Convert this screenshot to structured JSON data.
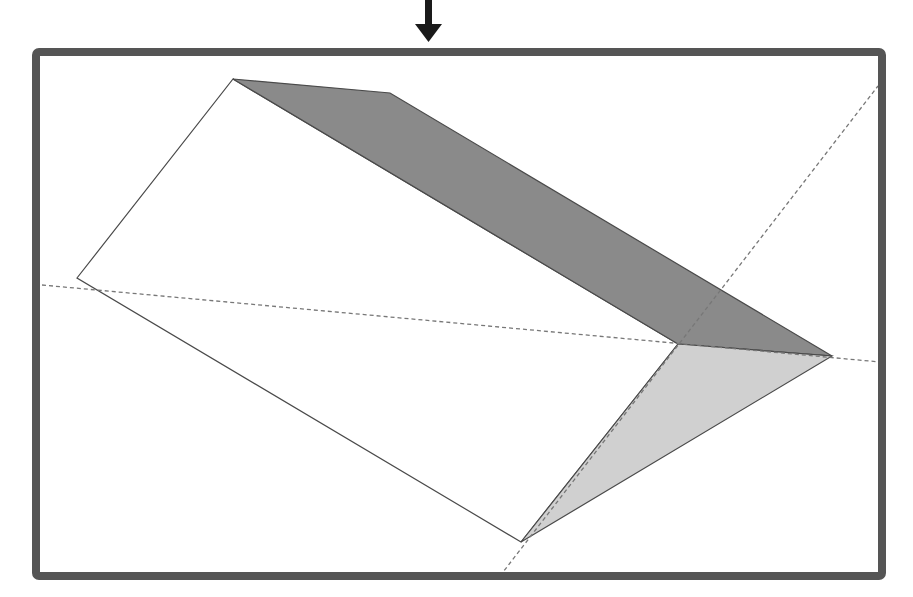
{
  "diagram": {
    "title": "3D prism cut diagram with dashed cutting plane",
    "arrow": {
      "x": 428,
      "y_top": 0,
      "y_tip": 42,
      "color": "#1a1a1a",
      "direction": "down"
    },
    "frame": {
      "x": 32,
      "y": 48,
      "width": 854,
      "height": 532,
      "stroke": "#555555",
      "stroke_width": 8
    },
    "colors": {
      "outline": "#4a4a4a",
      "dark_face": "#8a8a8a",
      "light_face": "#d0d0d0",
      "white_face": "#ffffff",
      "dash": "#777777"
    },
    "vertices": {
      "top_left": [
        233,
        79
      ],
      "top_kink": [
        390,
        93
      ],
      "left": [
        77,
        278
      ],
      "inner": [
        678,
        344
      ],
      "right": [
        832,
        356
      ],
      "bottom": [
        521,
        542
      ]
    },
    "faces": [
      {
        "name": "dark-top-face",
        "points": "233,79 390,93 832,356 678,344",
        "fill_key": "dark_face"
      },
      {
        "name": "light-end-face",
        "points": "678,344 832,356 521,542",
        "fill_key": "light_face"
      },
      {
        "name": "white-side-face",
        "points": "233,79 678,344 521,542 77,278",
        "fill_key": "white_face"
      }
    ],
    "dashed_lines": [
      {
        "name": "horizontal-cut-line",
        "x1": 42,
        "y1": 285,
        "x2": 880,
        "y2": 362
      },
      {
        "name": "diagonal-cut-line",
        "x1": 500,
        "y1": 576,
        "x2": 878,
        "y2": 86
      }
    ]
  }
}
